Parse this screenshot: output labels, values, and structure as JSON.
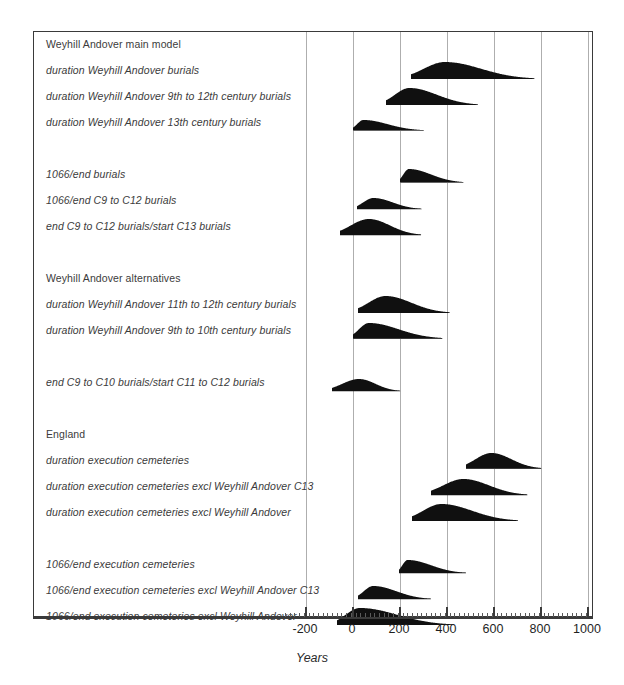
{
  "chart_data": {
    "type": "area",
    "title": "",
    "xlabel": "Years",
    "ylabel": "",
    "xlim": [
      -285,
      1010
    ],
    "grid": true,
    "legend": "none",
    "xticks": [
      -200,
      0,
      200,
      400,
      600,
      800,
      1000
    ],
    "xtick_labels": [
      "-200",
      "0",
      "200",
      "400",
      "600",
      "800",
      "1000"
    ],
    "minor_tick_interval": 20,
    "series_fill_color": "#101010",
    "baseline_color": "#b9b9b9",
    "gridline_color": "#aeaeae",
    "rows": [
      {
        "kind": "heading",
        "label": "Weyhill Andover main model"
      },
      {
        "kind": "distribution",
        "label": "duration Weyhill Andover burials",
        "peak": 390,
        "start": 245,
        "end": 770,
        "mode_height": 1.0,
        "spread": 95
      },
      {
        "kind": "distribution",
        "label": "duration Weyhill Andover 9th to 12th century burials",
        "peak": 240,
        "start": 140,
        "end": 530,
        "mode_height": 1.0,
        "spread": 62
      },
      {
        "kind": "distribution",
        "label": "duration Weyhill Andover 13th century burials",
        "peak": 45,
        "start": 0,
        "end": 300,
        "mode_height": 0.62,
        "spread": 35
      },
      {
        "kind": "spacer",
        "label": ""
      },
      {
        "kind": "distribution",
        "label": "1066/end burials",
        "peak": 238,
        "start": 200,
        "end": 470,
        "mode_height": 0.8,
        "spread": 30
      },
      {
        "kind": "distribution",
        "label": "1066/end C9 to C12 burials",
        "peak": 85,
        "start": 15,
        "end": 290,
        "mode_height": 0.66,
        "spread": 38
      },
      {
        "kind": "distribution",
        "label": "end C9 to C12 burials/start C13 burials",
        "peak": 68,
        "start": -55,
        "end": 290,
        "mode_height": 0.95,
        "spread": 58
      },
      {
        "kind": "spacer",
        "label": ""
      },
      {
        "kind": "heading",
        "label": "Weyhill Andover alternatives"
      },
      {
        "kind": "distribution",
        "label": "duration Weyhill Andover 11th to 12th century burials",
        "peak": 138,
        "start": 20,
        "end": 410,
        "mode_height": 1.0,
        "spread": 58
      },
      {
        "kind": "distribution",
        "label": "duration Weyhill Andover 9th to 10th century burials",
        "peak": 68,
        "start": 0,
        "end": 380,
        "mode_height": 0.92,
        "spread": 52
      },
      {
        "kind": "spacer",
        "label": ""
      },
      {
        "kind": "distribution",
        "label": "end C9 to C10 burials/start C11 to C12 burials",
        "peak": 25,
        "start": -90,
        "end": 200,
        "mode_height": 0.72,
        "spread": 32
      },
      {
        "kind": "spacer",
        "label": ""
      },
      {
        "kind": "heading",
        "label": "England"
      },
      {
        "kind": "distribution",
        "label": "duration execution cemeteries",
        "peak": 588,
        "start": 480,
        "end": 800,
        "mode_height": 0.92,
        "spread": 48
      },
      {
        "kind": "distribution",
        "label": "duration execution cemeteries excl Weyhill Andover C13",
        "peak": 468,
        "start": 330,
        "end": 740,
        "mode_height": 0.95,
        "spread": 62
      },
      {
        "kind": "distribution",
        "label": "duration execution cemeteries excl Weyhill Andover",
        "peak": 375,
        "start": 250,
        "end": 700,
        "mode_height": 1.0,
        "spread": 78
      },
      {
        "kind": "spacer",
        "label": ""
      },
      {
        "kind": "distribution",
        "label": "1066/end execution cemeteries",
        "peak": 232,
        "start": 195,
        "end": 480,
        "mode_height": 0.78,
        "spread": 30
      },
      {
        "kind": "distribution",
        "label": "1066/end execution cemeteries excl Weyhill Andover C13",
        "peak": 85,
        "start": 20,
        "end": 330,
        "mode_height": 0.78,
        "spread": 40
      },
      {
        "kind": "distribution",
        "label": "1066/end execution cemeteries excl Weyhill Andover",
        "peak": 28,
        "start": -70,
        "end": 420,
        "mode_height": 1.0,
        "spread": 55
      }
    ]
  }
}
